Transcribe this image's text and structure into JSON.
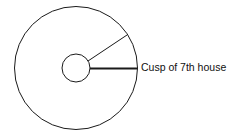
{
  "diagram": {
    "label": "Cusp of 7th house",
    "colors": {
      "stroke": "#1a1a1a",
      "background": "#ffffff"
    }
  }
}
